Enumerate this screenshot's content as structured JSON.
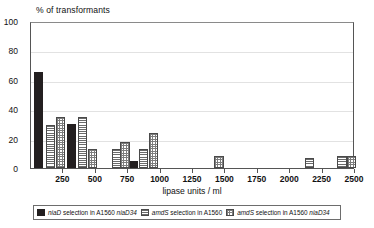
{
  "chart_data": {
    "type": "bar",
    "title": "% of transformants",
    "xlabel": "lipase units / ml",
    "ylabel": "% of transformants",
    "xlim": [
      0,
      2500
    ],
    "ylim": [
      0,
      100
    ],
    "ytick_labels": [
      "0",
      "20",
      "40",
      "60",
      "80",
      "100"
    ],
    "ytick_values": [
      0,
      20,
      40,
      60,
      80,
      100
    ],
    "xtick_labels": [
      "250",
      "500",
      "750",
      "1000",
      "1250",
      "1500",
      "1750",
      "2000",
      "2250",
      "2500"
    ],
    "xtick_values": [
      250,
      500,
      750,
      1000,
      1250,
      1500,
      1750,
      2000,
      2250,
      2500
    ],
    "grid": true,
    "legend_position": "bottom",
    "series": [
      {
        "name": "niaD selection in A1560 niaD34",
        "pattern": "solid-black",
        "color": "#231f20",
        "points": [
          {
            "x": 60,
            "y": 65
          },
          {
            "x": 310,
            "y": 30
          },
          {
            "x": 790,
            "y": 5
          }
        ]
      },
      {
        "name": "amdS selection in A1560",
        "pattern": "horizontal-stripes",
        "color": "#6b6b6b",
        "points": [
          {
            "x": 150,
            "y": 29
          },
          {
            "x": 395,
            "y": 35
          },
          {
            "x": 660,
            "y": 13
          },
          {
            "x": 870,
            "y": 13
          },
          {
            "x": 2150,
            "y": 7
          },
          {
            "x": 2400,
            "y": 8
          }
        ]
      },
      {
        "name": "amdS selection in A1560 niaD34",
        "pattern": "checkered",
        "color": "#7d7d7d",
        "points": [
          {
            "x": 230,
            "y": 35
          },
          {
            "x": 475,
            "y": 13
          },
          {
            "x": 725,
            "y": 18
          },
          {
            "x": 945,
            "y": 24
          },
          {
            "x": 1450,
            "y": 8
          },
          {
            "x": 2470,
            "y": 8
          }
        ]
      }
    ]
  },
  "legend": {
    "items": [
      {
        "label_italic_1": "niaD",
        "label_mid": " selection in A1560 ",
        "label_italic_2": "niaD34",
        "pattern": "solid-black"
      },
      {
        "label_italic_1": "amdS",
        "label_mid": " selection in A1560",
        "label_italic_2": "",
        "pattern": "horizontal-stripes"
      },
      {
        "label_italic_1": "amdS",
        "label_mid": " selection in A1560 ",
        "label_italic_2": "niaD34",
        "pattern": "checkered"
      }
    ]
  }
}
